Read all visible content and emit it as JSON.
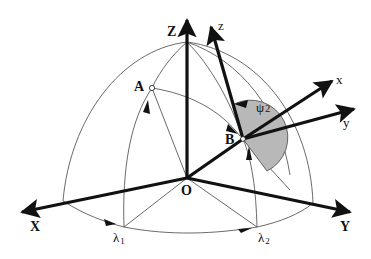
{
  "diagram": {
    "type": "spherical coordinate geometry",
    "labels": {
      "Z": "Z",
      "X": "X",
      "Y": "Y",
      "O": "O",
      "A": "A",
      "B": "B",
      "z": "z",
      "x": "x",
      "y": "y",
      "psi": "ψ",
      "psi_sub": "2",
      "lambda1": "λ",
      "lambda1_sub": "1",
      "lambda2": "λ",
      "lambda2_sub": "2"
    },
    "colors": {
      "stroke": "#111111",
      "thin_stroke": "#444444",
      "shade": "#b8b8b8",
      "background": "#ffffff"
    }
  }
}
